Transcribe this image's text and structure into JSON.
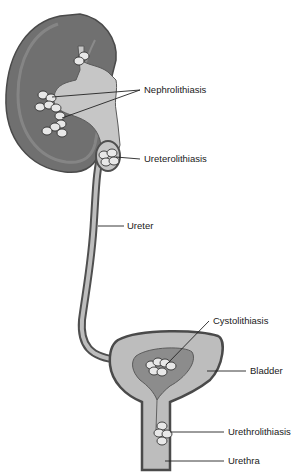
{
  "diagram": {
    "labels": {
      "nephrolithiasis": "Nephrolithiasis",
      "ureterolithiasis": "Ureterolithiasis",
      "ureter": "Ureter",
      "cystolithiasis": "Cystolithiasis",
      "bladder": "Bladder",
      "urethrolithiasis": "Urethrolithiasis",
      "urethra": "Urethra"
    },
    "colors": {
      "kidney_outer": "#6e6e6e",
      "kidney_cortex": "#8a8a8a",
      "pelvis_fill": "#c4c4c4",
      "outline": "#4a4a4a",
      "bladder_fill": "#bdbdbd",
      "bladder_inner": "#8c8c8c",
      "stone": "#e8e8e8"
    }
  }
}
